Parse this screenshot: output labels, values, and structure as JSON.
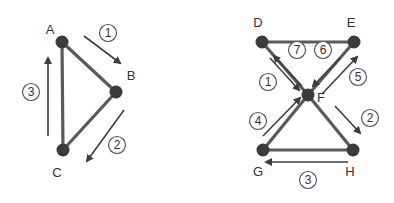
{
  "colors": {
    "node": "#3b3b3b",
    "edge": "#5a5a5a",
    "arrow": "#3e3e3e",
    "label": "#333333",
    "step_circle": "#555555",
    "background": "#ffffff"
  },
  "graph_left": {
    "nodes": [
      {
        "id": "A",
        "label": "A",
        "x": 62,
        "y": 42,
        "lx": 50,
        "ly": 34
      },
      {
        "id": "B",
        "label": "B",
        "x": 116,
        "y": 92,
        "lx": 131,
        "ly": 80
      },
      {
        "id": "C",
        "label": "C",
        "x": 63,
        "y": 150,
        "lx": 57,
        "ly": 177
      }
    ],
    "edges": [
      [
        "A",
        "B"
      ],
      [
        "B",
        "C"
      ],
      [
        "A",
        "C"
      ]
    ],
    "steps": [
      {
        "label": "1",
        "cx": 108,
        "cy": 33,
        "x1": 84,
        "y1": 36,
        "x2": 120,
        "y2": 63
      },
      {
        "label": "2",
        "cx": 117,
        "cy": 145,
        "x1": 124,
        "y1": 110,
        "x2": 87,
        "y2": 161
      },
      {
        "label": "3",
        "cx": 31,
        "cy": 92,
        "x1": 48,
        "y1": 136,
        "x2": 48,
        "y2": 58
      }
    ]
  },
  "graph_right": {
    "nodes": [
      {
        "id": "D",
        "label": "D",
        "x": 262,
        "y": 42,
        "lx": 258,
        "ly": 27
      },
      {
        "id": "E",
        "label": "E",
        "x": 354,
        "y": 42,
        "lx": 351,
        "ly": 27
      },
      {
        "id": "F",
        "label": "F",
        "x": 308,
        "y": 95,
        "lx": 321,
        "ly": 102
      },
      {
        "id": "G",
        "label": "G",
        "x": 263,
        "y": 150,
        "lx": 258,
        "ly": 176
      },
      {
        "id": "H",
        "label": "H",
        "x": 353,
        "y": 150,
        "lx": 350,
        "ly": 176
      }
    ],
    "edges": [
      [
        "D",
        "E"
      ],
      [
        "D",
        "F"
      ],
      [
        "E",
        "F"
      ],
      [
        "F",
        "G"
      ],
      [
        "F",
        "H"
      ],
      [
        "G",
        "H"
      ]
    ],
    "steps": [
      {
        "label": "1",
        "cx": 268,
        "cy": 82,
        "x1": 270,
        "y1": 58,
        "x2": 299,
        "y2": 90
      },
      {
        "label": "2",
        "cx": 370,
        "cy": 118,
        "x1": 335,
        "y1": 106,
        "x2": 360,
        "y2": 133
      },
      {
        "label": "3",
        "cx": 308,
        "cy": 180,
        "x1": 348,
        "y1": 162,
        "x2": 266,
        "y2": 162
      },
      {
        "label": "4",
        "cx": 258,
        "cy": 121,
        "x1": 263,
        "y1": 136,
        "x2": 300,
        "y2": 98
      },
      {
        "label": "5",
        "cx": 358,
        "cy": 77,
        "x1": 322,
        "y1": 94,
        "x2": 357,
        "y2": 57
      },
      {
        "label": "6",
        "cx": 323,
        "cy": 50,
        "x1": 340,
        "y1": 58,
        "x2": 313,
        "y2": 86
      },
      {
        "label": "7",
        "cx": 297,
        "cy": 50,
        "x1": 302,
        "y1": 86,
        "x2": 274,
        "y2": 56
      }
    ]
  }
}
